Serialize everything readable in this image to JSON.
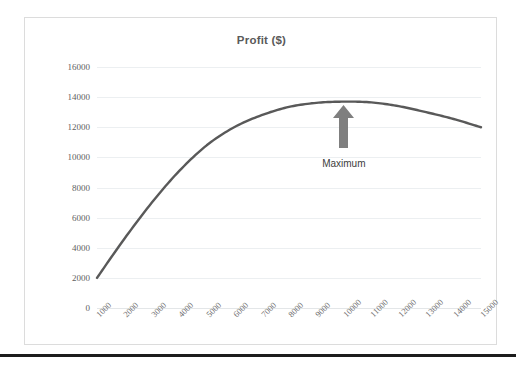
{
  "chart_data": {
    "type": "line",
    "title": "Profit ($)",
    "xlabel": "",
    "ylabel": "",
    "categories": [
      "1000",
      "2000",
      "3000",
      "4000",
      "5000",
      "6000",
      "7000",
      "8000",
      "9000",
      "10000",
      "11000",
      "12000",
      "13000",
      "14000",
      "15000"
    ],
    "values": [
      2000,
      4600,
      7000,
      9100,
      10800,
      12000,
      12800,
      13350,
      13620,
      13700,
      13650,
      13400,
      13000,
      12550,
      12000
    ],
    "series": [
      {
        "name": "Profit",
        "values": [
          2000,
          4600,
          7000,
          9100,
          10800,
          12000,
          12800,
          13350,
          13620,
          13700,
          13650,
          13400,
          13000,
          12550,
          12000
        ],
        "color": "#595959"
      }
    ],
    "ylim": [
      0,
      16000
    ],
    "yticks": [
      "0",
      "2000",
      "4000",
      "6000",
      "8000",
      "10000",
      "12000",
      "14000",
      "16000"
    ],
    "ytick_values": [
      0,
      2000,
      4000,
      6000,
      8000,
      10000,
      12000,
      14000,
      16000
    ],
    "grid": true,
    "legend": false,
    "legend_position": "none",
    "annotations": [
      {
        "name": "maximum",
        "label": "Maximum",
        "icon": "up-arrow-icon",
        "points_to_category": "10000",
        "points_to_value": 13700,
        "color": "#7f7f7f"
      }
    ],
    "colors": {
      "line": "#595959",
      "gridline": "#eceff1",
      "title_text": "#5a5a5a",
      "tick_text": "#5f5f5f",
      "annotation_text": "#3d3d3d",
      "annotation_fill": "#7f7f7f",
      "frame_border": "#dcdcdc",
      "page_rule": "#1c1c1c",
      "background": "#ffffff"
    }
  }
}
